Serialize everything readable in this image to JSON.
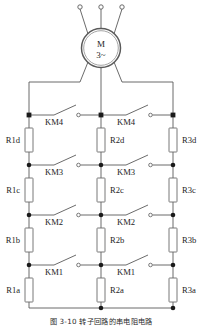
{
  "figure": {
    "caption": "图 3-10  转子回路的串电阻电路",
    "motor": {
      "symbol": "M",
      "phase_label": "3~",
      "terminal_count": 3
    },
    "columns": [
      {
        "name": "phase-1",
        "resistors": [
          "R1d",
          "R1c",
          "R1b",
          "R1a"
        ]
      },
      {
        "name": "phase-2",
        "resistors": [
          "R2d",
          "R2c",
          "R2b",
          "R2a"
        ]
      },
      {
        "name": "phase-3",
        "resistors": [
          "R3d",
          "R3c",
          "R3b",
          "R3a"
        ]
      }
    ],
    "contactor_rows": [
      {
        "label_left": "KM4",
        "label_right": "KM4"
      },
      {
        "label_left": "KM3",
        "label_right": "KM3"
      },
      {
        "label_left": "KM2",
        "label_right": "KM2"
      },
      {
        "label_left": "KM1",
        "label_right": "KM1"
      }
    ],
    "colors": {
      "wire": "#5a5a5a",
      "node": "#1a1a1a",
      "text": "#1d1d1d",
      "component_fill": "#ffffff",
      "background": "#ffffff"
    }
  }
}
